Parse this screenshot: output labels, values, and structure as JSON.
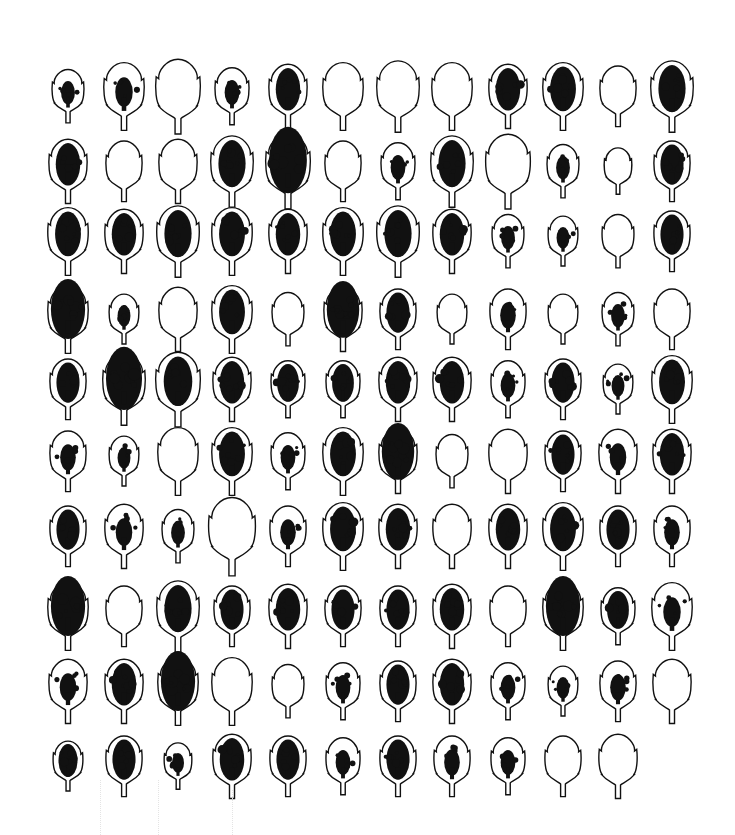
{
  "figure": {
    "background": "#ffffff",
    "ink_color": "#111111",
    "layout": {
      "rows": 10,
      "columns": 12,
      "col_x": [
        68,
        124,
        178,
        232,
        288,
        343,
        398,
        452,
        508,
        563,
        618,
        672
      ],
      "row_y": [
        95,
        170,
        240,
        318,
        388,
        460,
        535,
        615,
        690,
        765
      ]
    },
    "legend_codes": {
      "0": "unspotted",
      "1": "light spotting",
      "2": "moderate spotting",
      "3": "heavy spotting"
    },
    "rows": [
      {
        "spots": [
          1,
          1,
          0,
          1,
          2,
          0,
          0,
          0,
          2,
          2,
          0,
          2
        ],
        "sizes": [
          0.75,
          0.95,
          1.05,
          0.8,
          0.9,
          0.95,
          1.0,
          0.95,
          0.9,
          0.95,
          0.85,
          1.0
        ]
      },
      {
        "spots": [
          2,
          0,
          0,
          2,
          3,
          0,
          1,
          2,
          0,
          1,
          0,
          2
        ],
        "sizes": [
          0.9,
          0.85,
          0.9,
          1.0,
          1.05,
          0.85,
          0.8,
          1.0,
          1.05,
          0.75,
          0.65,
          0.85
        ]
      },
      {
        "spots": [
          2,
          2,
          2,
          2,
          2,
          2,
          2,
          2,
          1,
          1,
          0,
          2
        ],
        "sizes": [
          0.95,
          0.9,
          1.0,
          0.95,
          0.9,
          0.95,
          1.0,
          0.9,
          0.75,
          0.7,
          0.75,
          0.85
        ]
      },
      {
        "spots": [
          3,
          1,
          0,
          2,
          0,
          3,
          2,
          0,
          1,
          0,
          1,
          0
        ],
        "sizes": [
          0.95,
          0.7,
          0.9,
          0.95,
          0.75,
          0.9,
          0.85,
          0.7,
          0.85,
          0.7,
          0.75,
          0.85
        ]
      },
      {
        "spots": [
          2,
          3,
          2,
          2,
          2,
          2,
          2,
          2,
          1,
          2,
          1,
          2
        ],
        "sizes": [
          0.85,
          1.0,
          1.05,
          0.9,
          0.8,
          0.8,
          0.9,
          0.9,
          0.8,
          0.85,
          0.7,
          0.95
        ]
      },
      {
        "spots": [
          1,
          1,
          0,
          2,
          1,
          2,
          3,
          0,
          0,
          2,
          1,
          2
        ],
        "sizes": [
          0.85,
          0.7,
          0.95,
          0.95,
          0.8,
          0.95,
          0.9,
          0.75,
          0.9,
          0.85,
          0.9,
          0.9
        ]
      },
      {
        "spots": [
          2,
          1,
          1,
          0,
          1,
          2,
          2,
          0,
          2,
          2,
          2,
          1
        ],
        "sizes": [
          0.85,
          0.9,
          0.75,
          1.1,
          0.85,
          0.95,
          0.9,
          0.9,
          0.9,
          0.95,
          0.85,
          0.85
        ]
      },
      {
        "spots": [
          3,
          0,
          2,
          2,
          2,
          2,
          2,
          2,
          0,
          3,
          2,
          1
        ],
        "sizes": [
          0.95,
          0.85,
          1.0,
          0.85,
          0.9,
          0.85,
          0.85,
          0.9,
          0.85,
          0.95,
          0.8,
          0.95
        ]
      },
      {
        "spots": [
          1,
          2,
          3,
          0,
          0,
          1,
          2,
          2,
          1,
          1,
          1,
          0
        ],
        "sizes": [
          0.9,
          0.9,
          0.95,
          0.95,
          0.75,
          0.8,
          0.85,
          0.9,
          0.8,
          0.7,
          0.85,
          0.9
        ]
      },
      {
        "spots": [
          2,
          2,
          1,
          2,
          2,
          1,
          2,
          1,
          1,
          0,
          0
        ],
        "sizes": [
          0.7,
          0.85,
          0.65,
          0.9,
          0.85,
          0.8,
          0.85,
          0.85,
          0.8,
          0.85,
          0.9
        ]
      }
    ]
  }
}
